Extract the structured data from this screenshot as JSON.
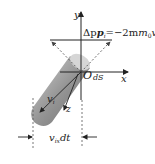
{
  "diagram": {
    "axes": {
      "y_label": "y",
      "x_label": "x",
      "z_label": "z",
      "origin_label": "O"
    },
    "area_label": "dS",
    "momentum_label": "Δp",
    "momentum_sub": "i",
    "momentum_eq": "=−2m",
    "m_sub": "0",
    "v_sym": "v",
    "v_sub": "ix",
    "unit_vec": "i",
    "velocity_label": "v",
    "velocity_sub": "i",
    "width_label_v": "v",
    "width_label_sub": "ix",
    "width_label_dt": "dt",
    "colors": {
      "cylinder_dark": "#6e6e6e",
      "cylinder_light": "#bdbdbd",
      "line": "#222222",
      "dash": "#555555"
    }
  }
}
